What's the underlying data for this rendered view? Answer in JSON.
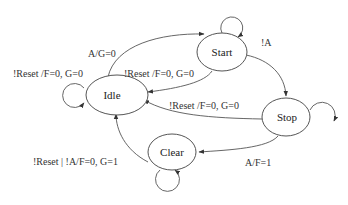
{
  "diagram": {
    "type": "state-machine",
    "states": [
      {
        "id": "idle",
        "label": "Idle"
      },
      {
        "id": "start",
        "label": "Start"
      },
      {
        "id": "stop",
        "label": "Stop"
      },
      {
        "id": "clear",
        "label": "Clear"
      }
    ],
    "transitions": [
      {
        "from": "idle",
        "to": "idle",
        "label": "!Reset /F=0, G=0"
      },
      {
        "from": "idle",
        "to": "start",
        "label": "A/G=0"
      },
      {
        "from": "start",
        "to": "start",
        "label": ""
      },
      {
        "from": "start",
        "to": "idle",
        "label": "!Reset /F=0, G=0"
      },
      {
        "from": "start",
        "to": "stop",
        "label": "!A"
      },
      {
        "from": "stop",
        "to": "stop",
        "label": ""
      },
      {
        "from": "stop",
        "to": "idle",
        "label": "!Reset /F=0, G=0"
      },
      {
        "from": "stop",
        "to": "clear",
        "label": "A/F=1"
      },
      {
        "from": "clear",
        "to": "clear",
        "label": ""
      },
      {
        "from": "clear",
        "to": "idle",
        "label": "!Reset | !A/F=0, G=1"
      }
    ]
  }
}
